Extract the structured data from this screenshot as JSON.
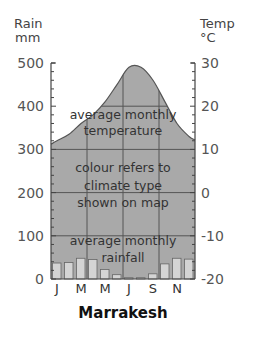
{
  "chart_data": {
    "type": "climate-graph",
    "title": "Marrakesh",
    "left_axis": {
      "label_line1": "Rain",
      "label_line2": "mm",
      "range": [
        0,
        500
      ],
      "ticks": [
        0,
        100,
        200,
        300,
        400,
        500
      ]
    },
    "right_axis": {
      "label_line1": "Temp",
      "label_line2": "°C",
      "range": [
        -20,
        30
      ],
      "ticks": [
        -20,
        -10,
        0,
        10,
        20,
        30
      ]
    },
    "months": [
      "J",
      "F",
      "M",
      "A",
      "M",
      "J",
      "J",
      "A",
      "S",
      "O",
      "N",
      "D"
    ],
    "month_tick_labels": [
      "J",
      "M",
      "M",
      "J",
      "S",
      "N"
    ],
    "series": [
      {
        "name": "average monthly rainfall",
        "type": "bar",
        "unit": "mm",
        "values": [
          37,
          38,
          48,
          45,
          22,
          10,
          3,
          3,
          12,
          35,
          48,
          46
        ]
      },
      {
        "name": "average monthly temperature",
        "type": "area",
        "unit": "°C",
        "values": [
          12,
          13.5,
          16,
          18,
          21,
          25,
          29,
          29,
          26,
          21,
          16,
          13
        ]
      }
    ],
    "annotations": {
      "temperature": [
        "average monthly",
        "temperature"
      ],
      "climate": [
        "colour refers to",
        "climate type",
        "shown on map"
      ],
      "rainfall": [
        "average monthly",
        "rainfall"
      ]
    },
    "grid": true,
    "fill_color": "#a9a9a9",
    "line_color": "#555555"
  }
}
